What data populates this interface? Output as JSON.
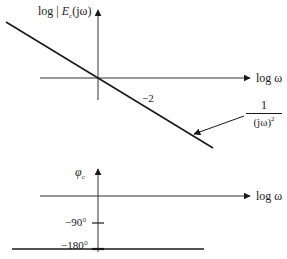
{
  "magnitude_plot": {
    "y_axis_label_prefix": "log | ",
    "y_axis_label_var": "E",
    "y_axis_label_sub": "c",
    "y_axis_label_suffix": "(jω)",
    "x_axis_label": "log ω",
    "slope_label": "−2",
    "curve_label_numerator": "1",
    "curve_label_denominator": "(jω)",
    "curve_label_exponent": "2"
  },
  "phase_plot": {
    "y_axis_label_var": "φ",
    "y_axis_label_sub": "c",
    "x_axis_label": "log ω",
    "tick_90_label": "−90°",
    "tick_180_label": "−180°"
  },
  "colors": {
    "line": "#1a1a1a",
    "axis": "#333333",
    "background": "#ffffff"
  }
}
